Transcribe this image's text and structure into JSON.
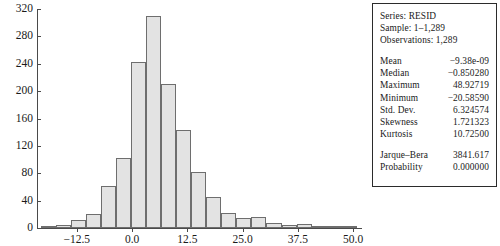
{
  "chart_data": {
    "type": "bar",
    "title": "",
    "xlabel": "",
    "ylabel": "",
    "grid": false,
    "legend": "none",
    "xlim": [
      -21.5,
      52.0
    ],
    "ylim": [
      0,
      320
    ],
    "y_ticks": [
      0,
      40,
      80,
      120,
      160,
      200,
      240,
      280,
      320
    ],
    "y_tick_labels": [
      "0",
      "40",
      "80",
      "120",
      "160",
      "200",
      "240",
      "280",
      "320"
    ],
    "x_ticks": [
      -12.5,
      0.0,
      12.5,
      25.0,
      37.5,
      50.0
    ],
    "x_tick_labels": [
      "-12.5",
      "0.0",
      "12.5",
      "25.0",
      "37.5",
      "50.0"
    ],
    "bin_width": 3.4,
    "bin_starts": [
      -20.6,
      -17.2,
      -13.8,
      -10.4,
      -7.0,
      -3.6,
      -0.2,
      3.2,
      6.6,
      10.0,
      13.4,
      16.8,
      20.2,
      23.6,
      27.0,
      30.4,
      33.8,
      37.2,
      40.6,
      44.0,
      47.4
    ],
    "values": [
      1,
      4,
      11,
      21,
      62,
      103,
      242,
      310,
      210,
      143,
      82,
      46,
      22,
      14,
      16,
      7,
      5,
      6,
      2,
      1,
      3
    ],
    "bar_fill": "#e3e3e3",
    "bar_edge": "#6e6e6e"
  },
  "axis": {
    "y_labels": [
      "320",
      "280",
      "240",
      "200",
      "160",
      "120",
      "80",
      "40",
      "0"
    ],
    "x_labels": [
      "-12.5",
      "0.0",
      "12.5",
      "25.0",
      "37.5",
      "50.0"
    ]
  },
  "stats_panel": {
    "header": [
      "Series: RESID",
      "Sample: 1–1,289",
      "Observations: 1,289"
    ],
    "rows": [
      {
        "label": "Mean",
        "value": "−9.38e-09"
      },
      {
        "label": "Median",
        "value": "−0.850280"
      },
      {
        "label": "Maximum",
        "value": "48.92719"
      },
      {
        "label": "Minimum",
        "value": "−20.58590"
      },
      {
        "label": "Std. Dev.",
        "value": "6.324574"
      },
      {
        "label": "Skewness",
        "value": "1.721323"
      },
      {
        "label": "Kurtosis",
        "value": "10.72500"
      }
    ],
    "rows2": [
      {
        "label": "Jarque–Bera",
        "value": "3841.617"
      },
      {
        "label": "Probability",
        "value": "0.000000"
      }
    ]
  }
}
